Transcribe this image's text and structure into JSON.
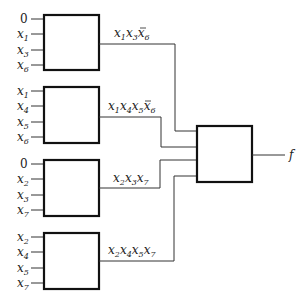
{
  "diagram": {
    "blocks": [
      {
        "id": "block-1",
        "inputs": [
          {
            "base": "0",
            "sub": ""
          },
          {
            "base": "x",
            "sub": "1"
          },
          {
            "base": "x",
            "sub": "3"
          },
          {
            "base": "x",
            "sub": "6"
          }
        ],
        "output_label": "x1x3x̄6",
        "output_terms": [
          {
            "base": "x",
            "sub": "1",
            "bar": false
          },
          {
            "base": "x",
            "sub": "3",
            "bar": false
          },
          {
            "base": "x",
            "sub": "6",
            "bar": true
          }
        ]
      },
      {
        "id": "block-2",
        "inputs": [
          {
            "base": "x",
            "sub": "1"
          },
          {
            "base": "x",
            "sub": "4"
          },
          {
            "base": "x",
            "sub": "5"
          },
          {
            "base": "x",
            "sub": "6"
          }
        ],
        "output_label": "x1x4x5x̄6",
        "output_terms": [
          {
            "base": "x",
            "sub": "1",
            "bar": false
          },
          {
            "base": "x",
            "sub": "4",
            "bar": false
          },
          {
            "base": "x",
            "sub": "5",
            "bar": false
          },
          {
            "base": "x",
            "sub": "6",
            "bar": true
          }
        ]
      },
      {
        "id": "block-3",
        "inputs": [
          {
            "base": "0",
            "sub": ""
          },
          {
            "base": "x",
            "sub": "2"
          },
          {
            "base": "x",
            "sub": "3"
          },
          {
            "base": "x",
            "sub": "7"
          }
        ],
        "output_label": "x2x3x7",
        "output_terms": [
          {
            "base": "x",
            "sub": "2",
            "bar": false
          },
          {
            "base": "x",
            "sub": "3",
            "bar": false
          },
          {
            "base": "x",
            "sub": "7",
            "bar": false
          }
        ]
      },
      {
        "id": "block-4",
        "inputs": [
          {
            "base": "x",
            "sub": "2"
          },
          {
            "base": "x",
            "sub": "4"
          },
          {
            "base": "x",
            "sub": "5"
          },
          {
            "base": "x",
            "sub": "7"
          }
        ],
        "output_label": "x2x4x5x7",
        "output_terms": [
          {
            "base": "x",
            "sub": "2",
            "bar": false
          },
          {
            "base": "x",
            "sub": "4",
            "bar": false
          },
          {
            "base": "x",
            "sub": "5",
            "bar": false
          },
          {
            "base": "x",
            "sub": "7",
            "bar": false
          }
        ]
      }
    ],
    "output_block": {
      "id": "output-block",
      "output_label": "f"
    }
  },
  "labels": {
    "b1_in": [
      "0",
      "x",
      "x",
      "x"
    ],
    "b1_in_sub": [
      "",
      "1",
      "3",
      "6"
    ],
    "b2_in": [
      "x",
      "x",
      "x",
      "x"
    ],
    "b2_in_sub": [
      "1",
      "4",
      "5",
      "6"
    ],
    "b3_in": [
      "0",
      "x",
      "x",
      "x"
    ],
    "b3_in_sub": [
      "",
      "2",
      "3",
      "7"
    ],
    "b4_in": [
      "x",
      "x",
      "x",
      "x"
    ],
    "b4_in_sub": [
      "2",
      "4",
      "5",
      "7"
    ],
    "x": "x",
    "f": "f",
    "b1_out_sub": [
      "1",
      "3",
      "6"
    ],
    "b2_out_sub": [
      "1",
      "4",
      "5",
      "6"
    ],
    "b3_out_sub": [
      "2",
      "3",
      "7"
    ],
    "b4_out_sub": [
      "2",
      "4",
      "5",
      "7"
    ]
  }
}
